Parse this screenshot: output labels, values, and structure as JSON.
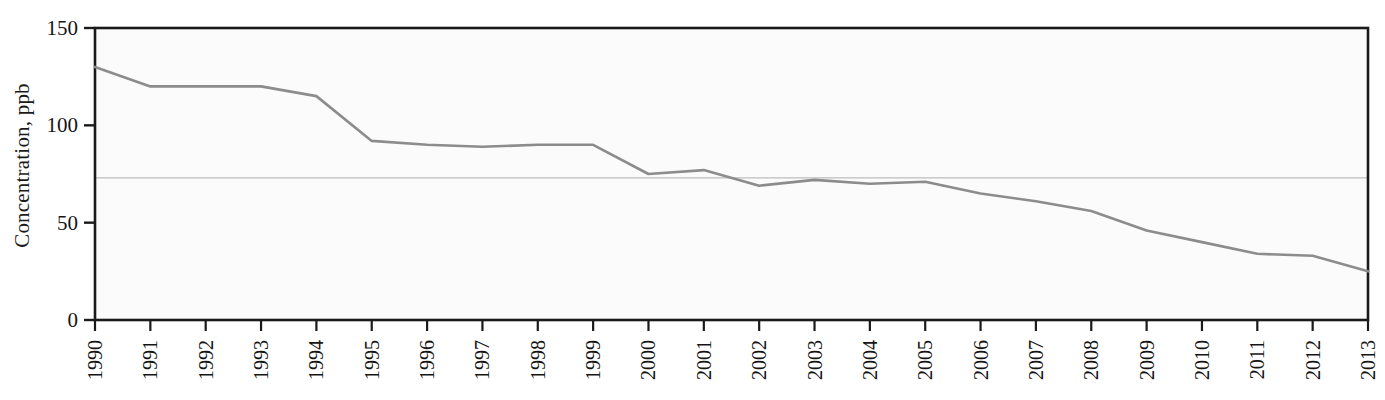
{
  "chart_data": {
    "type": "line",
    "title": "",
    "xlabel": "",
    "ylabel": "Concentration, ppb",
    "x": [
      1990,
      1991,
      1992,
      1993,
      1994,
      1995,
      1996,
      1997,
      1998,
      1999,
      2000,
      2001,
      2002,
      2003,
      2004,
      2005,
      2006,
      2007,
      2008,
      2009,
      2010,
      2011,
      2012,
      2013
    ],
    "categories": [
      "1990",
      "1991",
      "1992",
      "1993",
      "1994",
      "1995",
      "1996",
      "1997",
      "1998",
      "1999",
      "2000",
      "2001",
      "2002",
      "2003",
      "2004",
      "2005",
      "2006",
      "2007",
      "2008",
      "2009",
      "2010",
      "2011",
      "2012",
      "2013"
    ],
    "values": [
      130,
      120,
      120,
      120,
      115,
      92,
      90,
      89,
      90,
      90,
      75,
      77,
      69,
      72,
      70,
      71,
      65,
      61,
      56,
      46,
      40,
      34,
      33,
      25
    ],
    "series": [
      {
        "name": "Concentration",
        "color": "#8c8c8c",
        "values": [
          130,
          120,
          120,
          120,
          115,
          92,
          90,
          89,
          90,
          90,
          75,
          77,
          69,
          72,
          70,
          71,
          65,
          61,
          56,
          46,
          40,
          34,
          33,
          25
        ]
      }
    ],
    "annotations": [
      {
        "type": "hline",
        "name": "reference-line",
        "value": 73,
        "color": "#bdbdbd",
        "label": ""
      }
    ],
    "xlim": [
      1990,
      2013
    ],
    "ylim": [
      0,
      150
    ],
    "yticks": [
      0,
      50,
      100,
      150
    ],
    "ytick_labels": [
      "0",
      "50",
      "100",
      "150"
    ],
    "xtick_labels_rotation": -90,
    "grid": false,
    "legend": false,
    "legend_position": "none",
    "plot_background": "#fbfbfb",
    "frame_color": "#1a1a1a"
  },
  "axis": {
    "y_title": "Concentration, ppb"
  }
}
